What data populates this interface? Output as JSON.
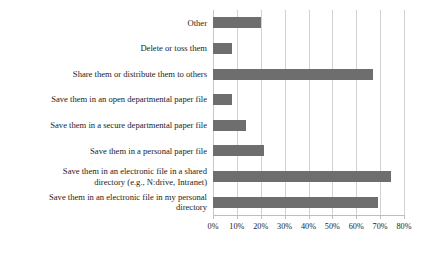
{
  "chart_data": {
    "type": "bar",
    "orientation": "horizontal",
    "title": "",
    "xlabel": "",
    "ylabel": "",
    "xlim": [
      0,
      80
    ],
    "xtick_step": 10,
    "grid": true,
    "legend": false,
    "bar_color": "#6e6e6e",
    "gridline_color": "#d2d2d2",
    "tick_labels": [
      "0%",
      "10%",
      "20%",
      "30%",
      "40%",
      "50%",
      "60%",
      "70%",
      "80%"
    ],
    "tick_values": [
      0,
      10,
      20,
      30,
      40,
      50,
      60,
      70,
      80
    ],
    "categories": [
      "Other",
      "Delete or toss them",
      "Share them or distribute them to others",
      "Save them in an open departmental paper file",
      "Save them in a secure departmental paper file",
      "Save them in a personal paper file",
      "Save them in an electronic file in a shared\ndirectory (e.g., N:drive, Intranet)",
      "Save them in an electronic file in my personal\ndirectory"
    ],
    "values": [
      20,
      8,
      67,
      8,
      14,
      21.5,
      74.5,
      69
    ]
  }
}
